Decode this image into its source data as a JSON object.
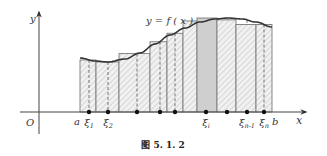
{
  "figure": {
    "caption": "图 5. 1. 2",
    "curve_label": "y = f ( x )",
    "axes": {
      "x_label": "x",
      "y_label": "y",
      "origin_label": "O"
    },
    "interval": {
      "a_label": "a",
      "b_label": "b"
    },
    "sample_labels": [
      "ξ1",
      "ξ2",
      "ξi",
      "ξn-1",
      "ξn"
    ],
    "colors": {
      "axis": "#444444",
      "curve": "#333333",
      "rect_stroke": "#7a7a7a",
      "hatch": "#c8c8c8",
      "highlight": "#cfcfcf",
      "dot": "#111111"
    }
  },
  "diagram_data": {
    "type": "riemann_sum",
    "partition_x_px": [
      80,
      96,
      119,
      150,
      167,
      183,
      197,
      217,
      236,
      256,
      272
    ],
    "sample_x_px": [
      89,
      108,
      137,
      160,
      175,
      206,
      227,
      247,
      264
    ],
    "highlighted_interval_index": 6,
    "labeled_samples": [
      {
        "label": "ξ1",
        "x_px": 89
      },
      {
        "label": "ξ2",
        "x_px": 108
      },
      {
        "label": "ξi",
        "x_px": 206
      },
      {
        "label": "ξn-1",
        "x_px": 247
      },
      {
        "label": "ξn",
        "x_px": 264
      }
    ]
  }
}
